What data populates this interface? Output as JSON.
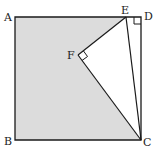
{
  "diagram": {
    "type": "geometry",
    "colors": {
      "shade": "#dcdcdc",
      "stroke": "#1a1a1a"
    },
    "points": {
      "A": {
        "label": "A",
        "x": 15,
        "y": 17
      },
      "B": {
        "label": "B",
        "x": 15,
        "y": 140
      },
      "C": {
        "label": "C",
        "x": 141,
        "y": 140
      },
      "D": {
        "label": "D",
        "x": 141,
        "y": 17
      },
      "E": {
        "label": "E",
        "x": 126,
        "y": 17
      },
      "F": {
        "label": "F",
        "x": 78,
        "y": 55
      }
    },
    "right_angles": [
      "D",
      "F"
    ]
  }
}
